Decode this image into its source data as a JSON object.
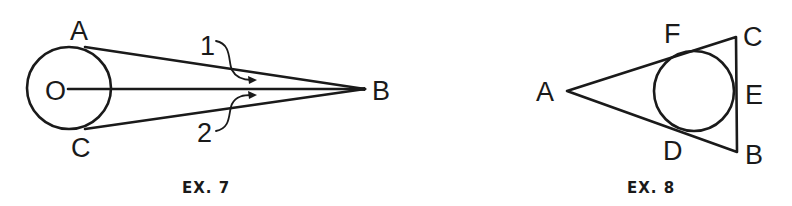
{
  "figures": [
    {
      "caption": "EX. 7",
      "points": {
        "A": "A",
        "O": "O",
        "C": "C",
        "B": "B"
      },
      "arrow_labels": {
        "one": "1",
        "two": "2"
      },
      "description": "Circle O with tangents from external point B touching at A and C; segment OB drawn; angles 1 and 2 marked"
    },
    {
      "caption": "EX. 8",
      "points": {
        "A": "A",
        "F": "F",
        "C": "C",
        "E": "E",
        "D": "D",
        "B": "B"
      },
      "description": "Triangle ABC with inscribed circle tangent at F, E, D"
    }
  ]
}
